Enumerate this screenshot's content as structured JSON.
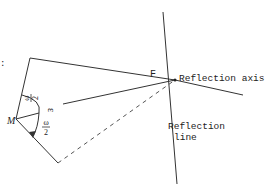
{
  "diagram": {
    "labels": {
      "point_f": "F",
      "point_m": "M",
      "reflection_axis": "Reflection axis",
      "reflection_line_1": "Reflection",
      "reflection_line_2": "line",
      "epsilon": "ε",
      "half_angle_num": "ω",
      "half_angle_den": "2",
      "half_angle2_num": "ω",
      "half_angle2_den": "2",
      "left_mark": ":"
    },
    "colors": {
      "stroke": "#333333",
      "background": "#ffffff"
    }
  }
}
